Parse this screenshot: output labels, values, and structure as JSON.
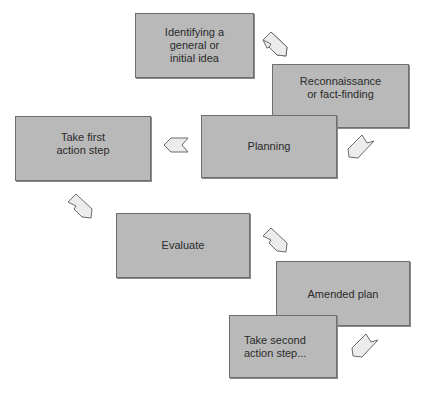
{
  "diagram": {
    "type": "action-research-cycle",
    "steps": [
      {
        "id": "idea",
        "label": "Identifying a\ngeneral or\ninitial idea"
      },
      {
        "id": "recon",
        "label": "Reconnaissance\nor fact-finding"
      },
      {
        "id": "planning",
        "label": "Planning"
      },
      {
        "id": "first-action",
        "label": "Take first\naction step"
      },
      {
        "id": "evaluate",
        "label": "Evaluate"
      },
      {
        "id": "amended-plan",
        "label": "Amended plan"
      },
      {
        "id": "second-action",
        "label": "Take second\naction step..."
      }
    ],
    "flow": [
      {
        "from": "idea",
        "to": "recon",
        "direction": "down-right"
      },
      {
        "from": "recon",
        "to": "planning",
        "direction": "down-left"
      },
      {
        "from": "planning",
        "to": "first-action",
        "direction": "left"
      },
      {
        "from": "first-action",
        "to": "evaluate",
        "direction": "down-right"
      },
      {
        "from": "evaluate",
        "to": "amended-plan",
        "direction": "down-right"
      },
      {
        "from": "amended-plan",
        "to": "second-action",
        "direction": "down-left"
      }
    ],
    "colors": {
      "box_fill": "#b9b9b9",
      "box_border": "#6e6e6e",
      "arrow_fill": "#ececec",
      "arrow_stroke": "#6a6a6a",
      "text": "#2a2a2a"
    }
  }
}
